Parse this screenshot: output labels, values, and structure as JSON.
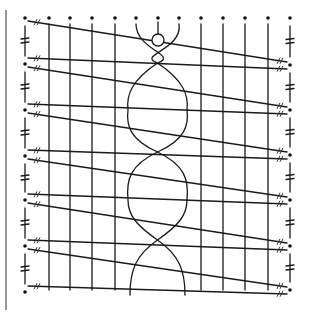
{
  "diagram": {
    "type": "bobbin-lace-pricking",
    "title": "",
    "colors": {
      "ink": "#1a1a1a",
      "paper": "#ffffff"
    },
    "border_line": {
      "x": 6,
      "y1": 10,
      "y2": 310
    },
    "top_pins_y": 18,
    "columns_x": [
      25,
      49,
      70,
      92,
      115,
      136,
      158,
      179,
      201,
      223,
      245,
      268,
      290
    ],
    "left_pins_y": [
      18,
      64,
      110,
      156,
      200,
      246,
      292
    ],
    "right_pins_y": [
      18,
      65,
      110,
      155,
      200,
      246,
      290
    ],
    "center_circle": {
      "x": 158,
      "y": 40,
      "r": 6
    },
    "braid_columns_x": [
      136,
      179
    ],
    "verticals_x": [
      49,
      70,
      92,
      115,
      201,
      223,
      245,
      268
    ],
    "vertical_bottom_y": 290
  }
}
